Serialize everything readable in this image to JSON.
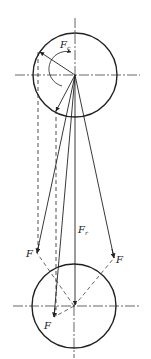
{
  "diagram": {
    "colors": {
      "stroke": "#222222",
      "background": "#ffffff"
    },
    "top_circle": {
      "label_main": "F",
      "label_sub": "c"
    },
    "bottom_circle": {
      "resultant_main": "F",
      "resultant_sub": "r",
      "force_left": "F",
      "force_right": "F",
      "force_bottom": "F"
    }
  }
}
